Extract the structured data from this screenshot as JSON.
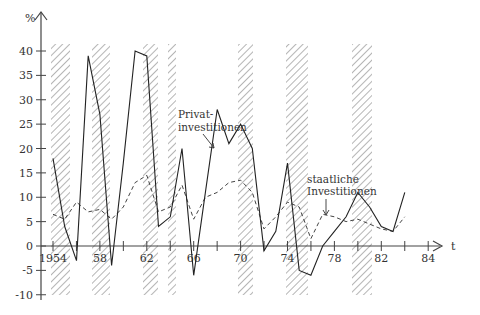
{
  "chart_data": {
    "type": "line",
    "title": "",
    "xlabel": "t",
    "ylabel": "%",
    "ylim": [
      -10,
      40
    ],
    "yticks": [
      -10,
      -5,
      0,
      5,
      10,
      15,
      20,
      25,
      30,
      35,
      40
    ],
    "xtick_labels": [
      "1954",
      "58",
      "62",
      "66",
      "70",
      "74",
      "78",
      "82",
      "84"
    ],
    "grid": false,
    "legend": "inline annotations",
    "shaded_periods_note": "hatched vertical bands mark recession periods",
    "series": [
      {
        "name": "Privatinvestitionen",
        "style": "solid",
        "points": [
          [
            0,
            18
          ],
          [
            1,
            4
          ],
          [
            2,
            -3
          ],
          [
            3,
            39
          ],
          [
            4,
            27
          ],
          [
            5,
            -4
          ],
          [
            6,
            17
          ],
          [
            7,
            40
          ],
          [
            8,
            39
          ],
          [
            9,
            4
          ],
          [
            10,
            6
          ],
          [
            11,
            20
          ],
          [
            12,
            -6
          ],
          [
            13,
            11
          ],
          [
            14,
            28
          ],
          [
            15,
            21
          ],
          [
            16,
            25
          ],
          [
            17,
            20
          ],
          [
            18,
            -1
          ],
          [
            19,
            3
          ],
          [
            20,
            17
          ],
          [
            21,
            -5
          ],
          [
            22,
            -6
          ],
          [
            23,
            0
          ],
          [
            24,
            3
          ],
          [
            25,
            6
          ],
          [
            26,
            11
          ],
          [
            27,
            8
          ],
          [
            28,
            4
          ],
          [
            29,
            3
          ],
          [
            30,
            11
          ]
        ]
      },
      {
        "name": "staatliche Investitionen",
        "style": "dashed",
        "points": [
          [
            0,
            6.5
          ],
          [
            1,
            5.5
          ],
          [
            2,
            9
          ],
          [
            3,
            7
          ],
          [
            4,
            7.5
          ],
          [
            5,
            5.5
          ],
          [
            6,
            8
          ],
          [
            7,
            13
          ],
          [
            8,
            14.5
          ],
          [
            9,
            7
          ],
          [
            10,
            8
          ],
          [
            11,
            12.5
          ],
          [
            12,
            5.5
          ],
          [
            13,
            10
          ],
          [
            14,
            11
          ],
          [
            15,
            13
          ],
          [
            16,
            13.5
          ],
          [
            17,
            11
          ],
          [
            18,
            3.5
          ],
          [
            19,
            6
          ],
          [
            20,
            9
          ],
          [
            21,
            8
          ],
          [
            22,
            1.5
          ],
          [
            23,
            6.5
          ],
          [
            24,
            6
          ],
          [
            25,
            5
          ],
          [
            26,
            5.5
          ],
          [
            27,
            4.5
          ],
          [
            28,
            3.5
          ],
          [
            29,
            3
          ],
          [
            30,
            6
          ]
        ]
      }
    ],
    "x_index_note": "point index i corresponds to half-tick step starting at 1954 (tick spacing ~23.4px)",
    "annotations": {
      "private_label_line1": "Privat-",
      "private_label_line2": "investitionen",
      "public_label_line1": "staatliche",
      "public_label_line2": "Investitionen"
    }
  }
}
